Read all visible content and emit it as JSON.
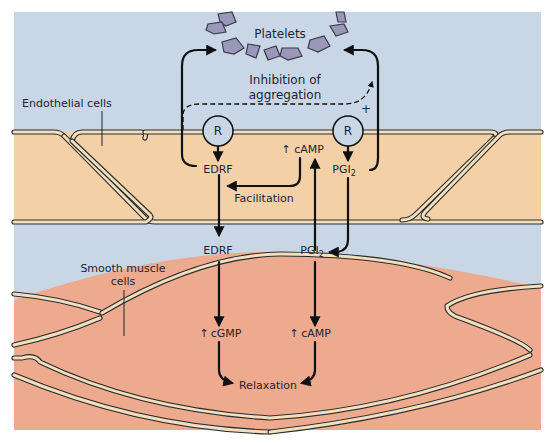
{
  "figure": {
    "type": "biological pathway diagram",
    "colors": {
      "lumen_background": "#c9d6e6",
      "endothelial_cell_fill": "#f3d0a6",
      "smooth_muscle_fill": "#eeaa8e",
      "membrane_highlight": "#f2dfc0",
      "membrane_outline": "#2b2b2b",
      "platelet_fill": "#9a98b8",
      "receptor_fill": "#c9d6e6",
      "text": "#1e2430"
    }
  },
  "labels": {
    "platelets": "Platelets",
    "inhibition_line1": "Inhibition of",
    "inhibition_line2": "aggregation",
    "plus_sign": "+",
    "endothelial_cells": "Endothelial cells",
    "smooth_muscle_line1": "Smooth muscle",
    "smooth_muscle_line2": "cells",
    "receptor_left": "R",
    "receptor_right": "R",
    "edrf_endothelial": "EDRF",
    "camp_endothelial": "cAMP",
    "camp_up_arrow": "↑",
    "pgi_endothelial": "PGI",
    "pgi_subscript": "2",
    "facilitation": "Facilitation",
    "edrf_lumen": "EDRF",
    "pgi_lumen": "PGI",
    "pgi_lumen_subscript": "2",
    "cgmp_muscle": "cGMP",
    "cgmp_up_arrow": "↑",
    "camp_muscle": "cAMP",
    "camp_muscle_up_arrow": "↑",
    "relaxation": "Relaxation"
  },
  "pathways": [
    {
      "from": "Receptor (left)",
      "to": "EDRF",
      "type": "release"
    },
    {
      "from": "Receptor (right)",
      "to": "PGI2",
      "type": "release"
    },
    {
      "from": "EDRF (endothelial)",
      "to": "Platelets",
      "type": "inhibition of aggregation"
    },
    {
      "from": "PGI2 (endothelial)",
      "to": "Platelets",
      "type": "inhibition of aggregation"
    },
    {
      "from": "EDRF (endothelial)",
      "to": "Platelets",
      "type": "dashed +, synergy"
    },
    {
      "from": "cAMP (endothelial)",
      "to": "EDRF",
      "type": "Facilitation"
    },
    {
      "from": "PGI2 (lumen)",
      "to": "cAMP (endothelial)",
      "type": "stimulation"
    },
    {
      "from": "EDRF (lumen)",
      "to": "cGMP (smooth muscle)",
      "type": "stimulation"
    },
    {
      "from": "PGI2 (lumen)",
      "to": "cAMP (smooth muscle)",
      "type": "stimulation"
    },
    {
      "from": "cGMP",
      "to": "Relaxation",
      "type": "effect"
    },
    {
      "from": "cAMP (smooth muscle)",
      "to": "Relaxation",
      "type": "effect"
    }
  ]
}
